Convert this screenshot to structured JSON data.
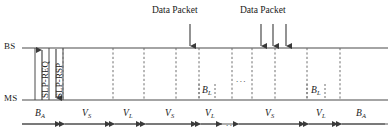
{
  "diagram": {
    "colors": {
      "line": "#4a4a4a",
      "dashed": "#6f6f6f",
      "text": "#1a1a1a",
      "background": "#ffffff"
    },
    "nodes": [
      {
        "id": "bs",
        "label": "BS",
        "y": 48
      },
      {
        "id": "ms",
        "label": "MS",
        "y": 100
      }
    ],
    "packet_groups": [
      {
        "caption": "Data Packet",
        "arrow_count": 1,
        "arrows_x": [
          190
        ]
      },
      {
        "caption": "Data Packet",
        "arrow_count": 3,
        "arrows_x": [
          261,
          273,
          286
        ]
      }
    ],
    "messages": [
      {
        "label": "SLP-REQ",
        "direction": "up",
        "x": 42
      },
      {
        "label": "SLP-RSP",
        "direction": "down",
        "x": 56
      }
    ],
    "frame_boundaries": [
      63,
      113,
      144,
      176,
      199,
      232,
      252,
      275,
      307,
      340
    ],
    "listening_windows": [
      {
        "label": "B",
        "sub": "L",
        "x": 206,
        "y": 92
      },
      {
        "label": "B",
        "sub": "L",
        "x": 315,
        "y": 92
      }
    ],
    "intervals": [
      {
        "label": "B",
        "sub": "A",
        "start": 22,
        "end": 63,
        "caps": "right"
      },
      {
        "label": "V",
        "sub": "S",
        "start": 63,
        "end": 113,
        "caps": "both"
      },
      {
        "label": "V",
        "sub": "L",
        "start": 113,
        "end": 144,
        "caps": "both"
      },
      {
        "label": "V",
        "sub": "S",
        "start": 144,
        "end": 199,
        "caps": "both"
      },
      {
        "label": "V",
        "sub": "L",
        "start": 199,
        "end": 224,
        "caps": "both"
      },
      {
        "label": "V",
        "sub": "S",
        "start": 237,
        "end": 307,
        "caps": "both"
      },
      {
        "label": "V",
        "sub": "L",
        "start": 307,
        "end": 340,
        "caps": "both"
      },
      {
        "label": "B",
        "sub": "A",
        "start": 340,
        "end": 385,
        "caps": "left"
      }
    ],
    "ellipses": [
      {
        "text": "...",
        "x": 236,
        "y": 74
      },
      {
        "text": "...",
        "x": 228,
        "y": 118
      }
    ]
  }
}
